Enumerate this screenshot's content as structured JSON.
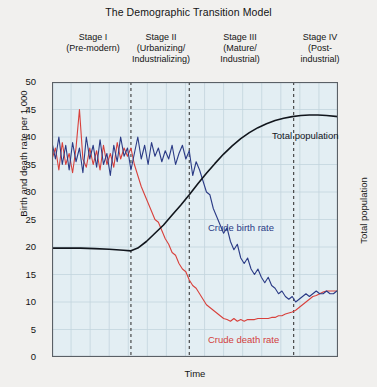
{
  "title": "The Demographic Transition Model",
  "axes": {
    "ylabel_left": "Birth and death rate per 1,000",
    "ylabel_right": "Total population",
    "xlabel": "Time",
    "yticks": [
      "50",
      "45",
      "40",
      "35",
      "30",
      "25",
      "20",
      "15",
      "10",
      "5",
      "0"
    ]
  },
  "stages": [
    {
      "name": "Stage I",
      "sub": "(Pre-modern)"
    },
    {
      "name": "Stage II",
      "sub": "(Urbanizing/\nIndustrializing)"
    },
    {
      "name": "Stage III",
      "sub": "(Mature/\nIndustrial)"
    },
    {
      "name": "Stage IV",
      "sub": "(Post-\nindustrial)"
    }
  ],
  "series_labels": {
    "population": "Total population",
    "birth": "Crude birth rate",
    "death": "Crude death rate"
  },
  "colors": {
    "birth": "#2b3b86",
    "death": "#d8413c",
    "population": "#11151c",
    "plot_background": "#e3eef3",
    "grid": "#c3d4dd",
    "divider": "#3a3a3a",
    "page_background": "#f1f0ee"
  },
  "chart_data": {
    "type": "line",
    "title": "The Demographic Transition Model",
    "xlabel": "Time",
    "ylabel": "Birth and death rate per 1,000",
    "ylabel_secondary": "Total population",
    "ylim": [
      0,
      50
    ],
    "ytick_step": 5,
    "grid": true,
    "legend": "inline-annotations",
    "x_range": [
      0,
      100
    ],
    "stage_boundaries": [
      27.6,
      48.0,
      84.5
    ],
    "series": [
      {
        "name": "Crude birth rate",
        "color": "#2b3b86",
        "axis": "left",
        "x": [
          0,
          1.2,
          2.4,
          3.6,
          4.8,
          6,
          7.2,
          8.4,
          9.6,
          10.8,
          12,
          13.2,
          14.4,
          15.6,
          16.8,
          18,
          19.2,
          20.4,
          21.6,
          22.8,
          24,
          25.2,
          26.4,
          27.6,
          28.8,
          30,
          31.2,
          32.4,
          33.6,
          34.8,
          36,
          37.2,
          38.4,
          39.6,
          40.8,
          42,
          43.2,
          44.4,
          45.6,
          46.8,
          48,
          49.2,
          50.4,
          51.6,
          52.8,
          54,
          55.2,
          56.4,
          57.6,
          58.8,
          60,
          61.2,
          62.4,
          63.6,
          64.8,
          66,
          67.2,
          68.4,
          69.6,
          70.8,
          72,
          73.2,
          74.4,
          75.6,
          76.8,
          78,
          79.2,
          80.4,
          81.6,
          82.8,
          84,
          85.2,
          86.4,
          87.6,
          88.8,
          90,
          91.2,
          92.4,
          93.6,
          94.8,
          96,
          97.2,
          98.4,
          99.6
        ],
        "y": [
          39,
          36,
          40,
          35,
          38.5,
          34,
          39,
          35.5,
          38,
          33.5,
          40,
          36,
          38.5,
          34.5,
          39.5,
          35,
          37,
          33,
          38.5,
          35.5,
          40,
          36.5,
          38,
          34,
          37,
          40,
          36,
          38.5,
          35,
          39,
          36.5,
          38,
          35.5,
          37.5,
          36,
          38.5,
          35,
          37,
          38.5,
          36,
          37.5,
          33,
          35.5,
          34,
          32,
          30,
          29.5,
          27,
          25.5,
          24,
          22.5,
          23.5,
          21,
          19.5,
          20.5,
          18,
          17,
          18,
          16,
          15,
          16,
          14.5,
          13.5,
          14.5,
          13,
          12.5,
          11.5,
          12,
          11,
          10.5,
          11,
          10,
          10.5,
          11,
          11.5,
          11,
          11.5,
          12,
          11.5,
          11.5,
          12,
          11.5,
          11.5,
          12
        ]
      },
      {
        "name": "Crude death rate",
        "color": "#d8413c",
        "axis": "left",
        "x": [
          0,
          1.2,
          2.4,
          3.6,
          4.8,
          6,
          7.2,
          8.4,
          9.6,
          10.8,
          12,
          13.2,
          14.4,
          15.6,
          16.8,
          18,
          19.2,
          20.4,
          21.6,
          22.8,
          24,
          25.2,
          26.4,
          27.6,
          28.8,
          30,
          31.2,
          32.4,
          33.6,
          34.8,
          36,
          37.2,
          38.4,
          39.6,
          40.8,
          42,
          43.2,
          44.4,
          45.6,
          46.8,
          48,
          49.2,
          50.4,
          51.6,
          52.8,
          54,
          55.2,
          56.4,
          57.6,
          58.8,
          60,
          61.2,
          62.4,
          63.6,
          64.8,
          66,
          67.2,
          68.4,
          69.6,
          70.8,
          72,
          73.2,
          74.4,
          75.6,
          76.8,
          78,
          79.2,
          80.4,
          81.6,
          82.8,
          84,
          85.2,
          86.4,
          87.6,
          88.8,
          90,
          91.2,
          92.4,
          93.6,
          94.8,
          96,
          97.2,
          98.4,
          99.6
        ],
        "y": [
          36,
          38,
          34,
          39,
          35,
          37,
          33.5,
          38,
          45,
          36,
          34.5,
          38,
          35,
          37.5,
          34,
          38.5,
          35,
          37,
          34.5,
          39,
          36,
          38,
          36.5,
          38,
          35,
          33,
          31,
          29.5,
          28,
          26.5,
          25,
          24.5,
          23,
          21.5,
          20.5,
          19,
          18.5,
          17,
          16,
          15.5,
          14,
          13,
          12.5,
          11.5,
          10.5,
          9.5,
          9,
          8.5,
          8,
          7.5,
          7,
          6.8,
          6.5,
          7,
          6.5,
          6.8,
          6.5,
          6.8,
          6.8,
          6.8,
          7,
          7,
          7,
          7,
          7.2,
          7.2,
          7.5,
          7.5,
          7.8,
          8,
          8.2,
          8.5,
          9,
          9.5,
          10,
          10.5,
          11,
          11.2,
          11.5,
          11.8,
          12,
          12,
          12,
          12
        ]
      },
      {
        "name": "Total population",
        "color": "#11151c",
        "axis": "right",
        "x": [
          0,
          5,
          10,
          15,
          20,
          25,
          27.6,
          30,
          33,
          36,
          39,
          42,
          45,
          48,
          51,
          54,
          57,
          60,
          63,
          66,
          69,
          72,
          75,
          78,
          81,
          84,
          87,
          90,
          93,
          96,
          100
        ],
        "y": [
          19.8,
          19.8,
          19.8,
          19.7,
          19.6,
          19.4,
          19.3,
          19.8,
          21,
          22.5,
          24,
          25.8,
          27.6,
          29.5,
          31.5,
          33.4,
          35.2,
          36.9,
          38.4,
          39.7,
          40.8,
          41.7,
          42.4,
          43,
          43.4,
          43.7,
          43.9,
          44,
          44,
          43.9,
          43.7
        ]
      }
    ]
  }
}
